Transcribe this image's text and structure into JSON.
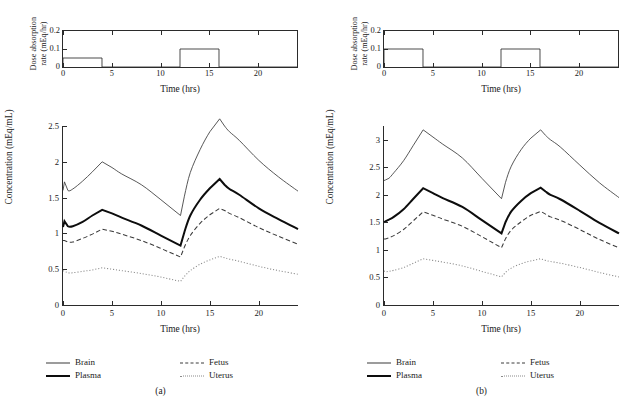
{
  "figure": {
    "panels": [
      {
        "caption": "(a)",
        "dose_chart": {
          "ylabel": "Dose absorption\nrate (mEq/hr)",
          "ylabel_line1": "Dose absorption",
          "ylabel_line2": "rate (mEq/hr)",
          "xlabel": "Time (hrs)",
          "yticks": [
            "0.2",
            "0.1",
            "0"
          ],
          "ytick_values": [
            0.2,
            0.1,
            0
          ],
          "xticks": [
            "0",
            "5",
            "10",
            "15",
            "20"
          ],
          "xtick_values": [
            0,
            5,
            10,
            15,
            20
          ]
        },
        "main_chart": {
          "ylabel": "Concentration (mEq/mL)",
          "xlabel": "Time (hrs)",
          "yticks": [
            "0",
            "0.5",
            "1",
            "1.5",
            "2",
            "2.5"
          ],
          "ytick_values": [
            0,
            0.5,
            1,
            1.5,
            2,
            2.5
          ],
          "xticks": [
            "0",
            "5",
            "10",
            "15",
            "20"
          ],
          "xtick_values": [
            0,
            5,
            10,
            15,
            20
          ]
        },
        "legend": [
          {
            "label": "Brain",
            "style": "thin-solid"
          },
          {
            "label": "Plasma",
            "style": "thick-solid"
          },
          {
            "label": "Fetus",
            "style": "dashed"
          },
          {
            "label": "Uterus",
            "style": "dotted"
          }
        ]
      },
      {
        "caption": "(b)",
        "dose_chart": {
          "ylabel": "Dose absorption\nrate (mEq/hr)",
          "ylabel_line1": "Dose absorption",
          "ylabel_line2": "rate (mEq/hr)",
          "xlabel": "Time (hrs)",
          "yticks": [
            "0.2",
            "0.1",
            "0"
          ],
          "ytick_values": [
            0.2,
            0.1,
            0
          ],
          "xticks": [
            "0",
            "5",
            "10",
            "15",
            "20"
          ],
          "xtick_values": [
            0,
            5,
            10,
            15,
            20
          ]
        },
        "main_chart": {
          "ylabel": "Concentration (mEq/mL)",
          "xlabel": "Time (hrs)",
          "yticks": [
            "0",
            "0.5",
            "1",
            "1.5",
            "2",
            "2.5",
            "3"
          ],
          "ytick_values": [
            0,
            0.5,
            1,
            1.5,
            2,
            2.5,
            3
          ],
          "xticks": [
            "0",
            "5",
            "10",
            "15",
            "20"
          ],
          "xtick_values": [
            0,
            5,
            10,
            15,
            20
          ]
        },
        "legend": [
          {
            "label": "Brain",
            "style": "thin-solid"
          },
          {
            "label": "Plasma",
            "style": "thick-solid"
          },
          {
            "label": "Fetus",
            "style": "dashed"
          },
          {
            "label": "Uterus",
            "style": "dotted"
          }
        ]
      }
    ]
  },
  "colors": {
    "thin_line": "#3a3a3a",
    "thick_line": "#0d0d0d",
    "dashed_line": "#3a3a3a",
    "dotted_line": "#8a8a8a",
    "axis": "#2b2b2b",
    "background": "#ffffff"
  },
  "chart_data": [
    {
      "type": "line",
      "panel": "(a)",
      "subplot": "dose-absorption-rate",
      "title": "",
      "xlabel": "Time (hrs)",
      "ylabel": "Dose absorption rate (mEq/hr)",
      "xlim": [
        0,
        24
      ],
      "ylim": [
        0,
        0.2
      ],
      "grid": false,
      "legend_position": "none",
      "series": [
        {
          "name": "Dose absorption rate",
          "x": [
            0,
            0,
            4,
            4,
            12,
            12,
            16,
            16,
            24
          ],
          "values": [
            0,
            0.05,
            0.05,
            0,
            0,
            0.1,
            0.1,
            0,
            0
          ]
        }
      ],
      "annotations": [
        "First pulse: 0.05 mEq/hr from 0 to 4 hrs",
        "Second pulse: 0.10 mEq/hr from 12 to 16 hrs"
      ]
    },
    {
      "type": "line",
      "panel": "(a)",
      "subplot": "concentration",
      "title": "",
      "xlabel": "Time (hrs)",
      "ylabel": "Concentration (mEq/mL)",
      "xlim": [
        0,
        24
      ],
      "ylim": [
        0,
        2.5
      ],
      "grid": false,
      "legend_position": "below",
      "x": [
        0,
        0.15,
        0.5,
        1,
        2,
        3,
        4,
        5,
        6,
        8,
        10,
        12,
        12.4,
        13,
        14,
        15,
        16,
        16.5,
        17,
        18,
        20,
        22,
        24
      ],
      "series": [
        {
          "name": "Brain",
          "style": "thin-solid",
          "values": [
            1.6,
            1.72,
            1.6,
            1.62,
            1.73,
            1.86,
            2.0,
            1.92,
            1.83,
            1.68,
            1.47,
            1.25,
            1.52,
            1.85,
            2.17,
            2.42,
            2.6,
            2.5,
            2.42,
            2.3,
            2.02,
            1.79,
            1.59
          ]
        },
        {
          "name": "Plasma",
          "style": "thick-solid",
          "values": [
            1.09,
            1.17,
            1.1,
            1.1,
            1.16,
            1.25,
            1.33,
            1.28,
            1.22,
            1.11,
            0.97,
            0.83,
            1.02,
            1.25,
            1.47,
            1.63,
            1.76,
            1.68,
            1.62,
            1.54,
            1.35,
            1.2,
            1.06
          ]
        },
        {
          "name": "Fetus",
          "style": "dashed",
          "values": [
            0.9,
            0.9,
            0.88,
            0.88,
            0.93,
            0.99,
            1.06,
            1.03,
            0.99,
            0.9,
            0.79,
            0.67,
            0.81,
            0.97,
            1.14,
            1.26,
            1.35,
            1.32,
            1.28,
            1.22,
            1.08,
            0.96,
            0.85
          ]
        },
        {
          "name": "Uterus",
          "style": "dotted",
          "values": [
            0.48,
            0.47,
            0.45,
            0.45,
            0.47,
            0.49,
            0.52,
            0.5,
            0.48,
            0.44,
            0.39,
            0.33,
            0.4,
            0.48,
            0.57,
            0.63,
            0.68,
            0.66,
            0.64,
            0.61,
            0.54,
            0.48,
            0.43
          ]
        }
      ]
    },
    {
      "type": "line",
      "panel": "(b)",
      "subplot": "dose-absorption-rate",
      "title": "",
      "xlabel": "Time (hrs)",
      "ylabel": "Dose absorption rate (mEq/hr)",
      "xlim": [
        0,
        24
      ],
      "ylim": [
        0,
        0.2
      ],
      "grid": false,
      "legend_position": "none",
      "series": [
        {
          "name": "Dose absorption rate",
          "x": [
            0,
            0,
            4,
            4,
            12,
            12,
            16,
            16,
            24
          ],
          "values": [
            0,
            0.1,
            0.1,
            0,
            0,
            0.1,
            0.1,
            0,
            0
          ]
        }
      ],
      "annotations": [
        "First pulse: 0.10 mEq/hr from 0 to 4 hrs",
        "Second pulse: 0.10 mEq/hr from 12 to 16 hrs"
      ]
    },
    {
      "type": "line",
      "panel": "(b)",
      "subplot": "concentration",
      "title": "",
      "xlabel": "Time (hrs)",
      "ylabel": "Concentration (mEq/mL)",
      "xlim": [
        0,
        24
      ],
      "ylim": [
        0,
        3.25
      ],
      "grid": false,
      "legend_position": "below",
      "x": [
        0,
        0.15,
        0.5,
        1,
        2,
        3,
        4,
        5,
        6,
        8,
        10,
        12,
        12.4,
        13,
        14,
        15,
        16,
        16.5,
        17,
        18,
        20,
        22,
        24
      ],
      "series": [
        {
          "name": "Brain",
          "style": "thin-solid",
          "values": [
            2.26,
            2.27,
            2.3,
            2.4,
            2.62,
            2.9,
            3.18,
            3.05,
            2.92,
            2.67,
            2.3,
            1.93,
            2.22,
            2.52,
            2.82,
            3.03,
            3.18,
            3.08,
            3.0,
            2.87,
            2.54,
            2.22,
            1.95
          ]
        },
        {
          "name": "Plasma",
          "style": "thick-solid",
          "values": [
            1.5,
            1.52,
            1.55,
            1.6,
            1.74,
            1.93,
            2.12,
            2.03,
            1.94,
            1.78,
            1.54,
            1.3,
            1.5,
            1.7,
            1.89,
            2.03,
            2.13,
            2.06,
            2.0,
            1.92,
            1.71,
            1.49,
            1.3
          ]
        },
        {
          "name": "Fetus",
          "style": "dashed",
          "values": [
            1.2,
            1.2,
            1.22,
            1.26,
            1.37,
            1.53,
            1.69,
            1.63,
            1.56,
            1.43,
            1.24,
            1.04,
            1.2,
            1.36,
            1.51,
            1.63,
            1.7,
            1.65,
            1.6,
            1.54,
            1.37,
            1.19,
            1.04
          ]
        },
        {
          "name": "Uterus",
          "style": "dotted",
          "values": [
            0.62,
            0.6,
            0.61,
            0.63,
            0.68,
            0.76,
            0.84,
            0.81,
            0.78,
            0.71,
            0.61,
            0.51,
            0.59,
            0.67,
            0.75,
            0.8,
            0.84,
            0.81,
            0.79,
            0.76,
            0.68,
            0.59,
            0.51
          ]
        }
      ]
    }
  ]
}
